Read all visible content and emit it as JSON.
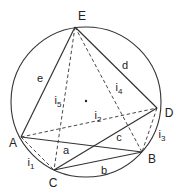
{
  "diagram": {
    "type": "inscribed-pentagon-geometry",
    "circle": {
      "cx": 86,
      "cy": 102,
      "r": 75
    },
    "center_dot": {
      "x": 86,
      "y": 101
    },
    "vertices": {
      "E": {
        "x": 75,
        "y": 27,
        "label": "E",
        "lx": 82,
        "ly": 16
      },
      "D": {
        "x": 157,
        "y": 108,
        "label": "D",
        "lx": 169,
        "ly": 113
      },
      "B": {
        "x": 142,
        "y": 152,
        "label": "B",
        "lx": 152,
        "ly": 159
      },
      "C": {
        "x": 54,
        "y": 170,
        "label": "C",
        "lx": 53,
        "ly": 183
      },
      "A": {
        "x": 21,
        "y": 137,
        "label": "A",
        "lx": 13,
        "ly": 143
      }
    },
    "solid_edges": [
      {
        "from": "A",
        "to": "E",
        "label": "e"
      },
      {
        "from": "E",
        "to": "D",
        "label": "d"
      },
      {
        "from": "D",
        "to": "C",
        "label": "c"
      },
      {
        "from": "C",
        "to": "B",
        "label": "b"
      },
      {
        "from": "B",
        "to": "A",
        "label": "a"
      }
    ],
    "dashed_edges": [
      {
        "from": "A",
        "to": "C",
        "label": "i",
        "sub": "1"
      },
      {
        "from": "A",
        "to": "D",
        "label": "i",
        "sub": "2"
      },
      {
        "from": "D",
        "to": "B",
        "label": "i",
        "sub": "3"
      },
      {
        "from": "E",
        "to": "B",
        "label": "i",
        "sub": "4"
      },
      {
        "from": "E",
        "to": "C",
        "label": "i",
        "sub": "5"
      }
    ],
    "edge_labels": {
      "e": {
        "text": "e",
        "x": 40,
        "y": 78
      },
      "d": {
        "text": "d",
        "x": 125,
        "y": 65
      },
      "c": {
        "text": "c",
        "x": 119,
        "y": 137
      },
      "b": {
        "text": "b",
        "x": 104,
        "y": 170
      },
      "a": {
        "text": "a",
        "x": 66,
        "y": 150
      },
      "i1": {
        "text": "i",
        "sub": "1",
        "x": 31,
        "y": 164
      },
      "i2": {
        "text": "i",
        "sub": "2",
        "x": 98,
        "y": 117
      },
      "i3": {
        "text": "i",
        "sub": "3",
        "x": 162,
        "y": 136
      },
      "i4": {
        "text": "i",
        "sub": "4",
        "x": 119,
        "y": 89
      },
      "i5": {
        "text": "i",
        "sub": "5",
        "x": 58,
        "y": 102
      }
    },
    "stroke_color": "#333333"
  }
}
